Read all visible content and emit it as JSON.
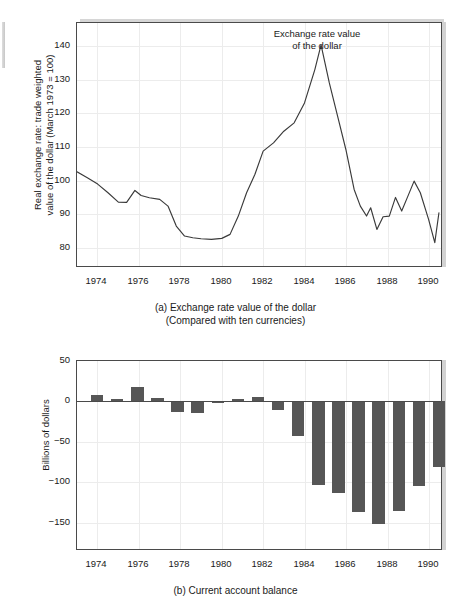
{
  "figure": {
    "panel_a": {
      "caption_line1": "(a) Exchange rate value of the dollar",
      "caption_line2": "(Compared with ten currencies)",
      "annotation_line1": "Exchange rate value",
      "annotation_line2": "of the dollar",
      "ylabel_line1": "Real exchange rate: trade weighted",
      "ylabel_line2": "value of the dollar (March 1973 = 100)",
      "yticks": [
        "140",
        "130",
        "120",
        "110",
        "100",
        "90",
        "80"
      ],
      "xticks": [
        "1974",
        "1976",
        "1978",
        "1980",
        "1982",
        "1984",
        "1986",
        "1988",
        "1990"
      ]
    },
    "panel_b": {
      "caption_line1": "(b) Current account balance",
      "ylabel_line1": "Billions of dollars",
      "yticks": [
        "50",
        "0",
        "−50",
        "−100",
        "−150"
      ],
      "xticks": [
        "1974",
        "1976",
        "1978",
        "1980",
        "1982",
        "1984",
        "1986",
        "1988",
        "1990"
      ]
    }
  },
  "chart_data": [
    {
      "type": "line",
      "id": "panel-a-exchange-rate",
      "title": "(a) Exchange rate value of the dollar",
      "subtitle": "(Compared with ten currencies)",
      "annotation": "Exchange rate value of the dollar",
      "xlabel": "",
      "ylabel": "Real exchange rate: trade weighted value of the dollar (March 1973 = 100)",
      "xlim": [
        1973.0,
        1990.6
      ],
      "ylim": [
        74,
        147
      ],
      "ytick_values": [
        80,
        90,
        100,
        110,
        120,
        130,
        140
      ],
      "xtick_values": [
        1974,
        1976,
        1978,
        1980,
        1982,
        1984,
        1986,
        1988,
        1990
      ],
      "grid": true,
      "legend": "none",
      "series": [
        {
          "name": "Real trade-weighted value of the dollar",
          "color": "#3a3a3a",
          "x": [
            1973.0,
            1973.5,
            1974.0,
            1974.5,
            1975.0,
            1975.4,
            1975.8,
            1976.1,
            1976.5,
            1977.0,
            1977.4,
            1977.8,
            1978.2,
            1978.6,
            1979.0,
            1979.5,
            1980.0,
            1980.4,
            1980.8,
            1981.2,
            1981.6,
            1982.0,
            1982.5,
            1983.0,
            1983.5,
            1984.0,
            1984.5,
            1984.8,
            1985.2,
            1985.6,
            1986.0,
            1986.4,
            1986.7,
            1987.0,
            1987.2,
            1987.5,
            1987.8,
            1988.1,
            1988.4,
            1988.7,
            1989.0,
            1989.3,
            1989.6,
            1990.0,
            1990.3,
            1990.5
          ],
          "y": [
            102.3,
            100.5,
            98.6,
            96.0,
            93.2,
            93.1,
            96.7,
            95.2,
            94.5,
            94.0,
            92.0,
            86.0,
            83.0,
            82.5,
            82.2,
            82.0,
            82.3,
            83.5,
            89.0,
            96.0,
            101.5,
            108.5,
            111.0,
            114.5,
            117.0,
            123.0,
            133.0,
            140.4,
            129.0,
            119.0,
            109.0,
            97.0,
            92.0,
            89.0,
            91.5,
            85.0,
            88.8,
            89.0,
            94.6,
            90.5,
            95.0,
            99.5,
            96.0,
            88.0,
            81.0,
            90.0
          ]
        }
      ]
    },
    {
      "type": "bar",
      "id": "panel-b-current-account",
      "title": "(b) Current account balance",
      "xlabel": "",
      "ylabel": "Billions of dollars",
      "xlim": [
        1972.5,
        1990.6
      ],
      "ylim": [
        -185,
        50
      ],
      "ytick_values": [
        50,
        0,
        -50,
        -100,
        -150
      ],
      "xtick_values": [
        1974,
        1976,
        1978,
        1980,
        1982,
        1984,
        1986,
        1988,
        1990
      ],
      "grid": true,
      "bar_color": "#565656",
      "categories": [
        1973,
        1974,
        1975,
        1976,
        1977,
        1978,
        1979,
        1980,
        1981,
        1982,
        1983,
        1984,
        1985,
        1986,
        1987,
        1988,
        1989,
        1990
      ],
      "values": [
        7,
        2,
        18,
        4,
        -14,
        -15,
        -1,
        2,
        5,
        -11,
        -44,
        -105,
        -115,
        -139,
        -154,
        -137,
        -106,
        -82
      ]
    }
  ]
}
